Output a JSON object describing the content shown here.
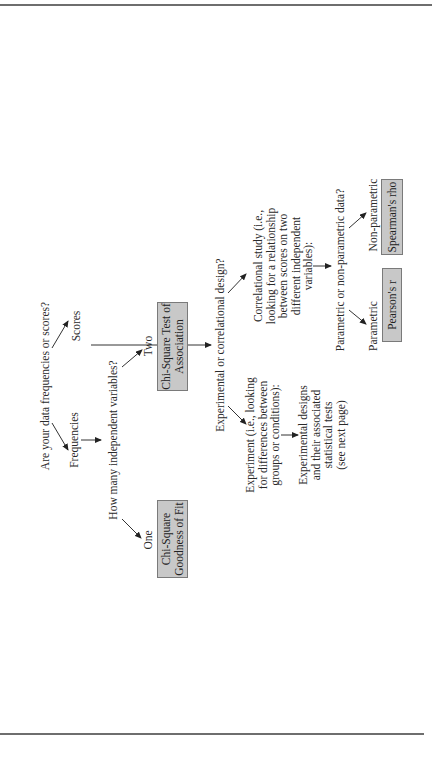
{
  "diagram": {
    "root_question": "Are your data frequencies or scores?",
    "branches": {
      "frequencies": {
        "label": "Frequencies",
        "question": "How many independent variables?",
        "options": [
          {
            "label": "One",
            "test": "Chi-Square Goodness of Fit",
            "test_lines": [
              "Chi-Square",
              "Goodness of Fit"
            ]
          },
          {
            "label": "Two",
            "test": "Chi-Square Test of Association",
            "test_lines": [
              "Chi-Square Test of",
              "Association"
            ]
          }
        ]
      },
      "scores": {
        "label": "Scores",
        "question": "Experimental or correlational design?",
        "experiment": {
          "lines": [
            "Experiment (i.e., looking",
            "for differences between",
            "groups or conditions):"
          ],
          "result_lines": [
            "Experimental designs",
            "and their associated",
            "statistical tests",
            "(see next page)"
          ]
        },
        "correlational": {
          "lines": [
            "Correlational study (i.e.,",
            "looking for a relationship",
            "between scores on two",
            "different independent",
            "variables):"
          ],
          "question": "Parametric or non-parametric data?",
          "options": [
            {
              "label": "Parametric",
              "test": "Pearson's r"
            },
            {
              "label": "Non-parametric",
              "test": "Spearman's rho"
            }
          ]
        }
      }
    },
    "colors": {
      "box_fill": "#c8c8c8",
      "box_border": "#7a7a7a",
      "text": "#2a2a2a",
      "rule": "#6e6e6e"
    }
  }
}
